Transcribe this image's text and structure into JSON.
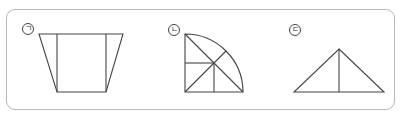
{
  "labels": {
    "a": "ㄱ",
    "b": "ㄴ",
    "c": "ㄷ"
  },
  "figures": [
    {
      "id": "a",
      "label": "ㄱ",
      "shape": "trapezoid divided by two vertical lines"
    },
    {
      "id": "b",
      "label": "ㄴ",
      "shape": "quarter circle divided into sections"
    },
    {
      "id": "c",
      "label": "ㄷ",
      "shape": "triangle divided by a vertical line"
    }
  ],
  "colors": {
    "frame": "#b8b8b8",
    "stroke": "#444444"
  }
}
